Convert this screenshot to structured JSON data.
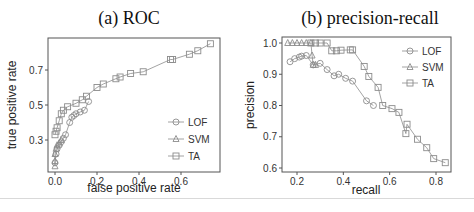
{
  "chart_data": [
    {
      "type": "line",
      "title": "(a) ROC",
      "xlabel": "false positive rate",
      "ylabel": "true positive rate",
      "xticks": [
        "0.0",
        "0.2",
        "0.4",
        "0.6"
      ],
      "yticks": [
        "0.3",
        "0.5",
        "0.7"
      ],
      "xlim": [
        -0.03,
        0.77
      ],
      "ylim": [
        0.13,
        0.88
      ],
      "grid": false,
      "legend_position": "inside-right",
      "series": [
        {
          "name": "LOF",
          "marker": "circle",
          "x": [
            0.0,
            0.005,
            0.01,
            0.02,
            0.03,
            0.04,
            0.05,
            0.07,
            0.08,
            0.09,
            0.1,
            0.12,
            0.14,
            0.16
          ],
          "y": [
            0.17,
            0.22,
            0.25,
            0.27,
            0.29,
            0.31,
            0.33,
            0.4,
            0.43,
            0.44,
            0.45,
            0.46,
            0.47,
            0.52
          ]
        },
        {
          "name": "SVM",
          "marker": "triangle",
          "x": [
            0.0,
            0.0,
            0.0,
            0.005,
            0.01,
            0.02,
            0.03
          ],
          "y": [
            0.15,
            0.18,
            0.22,
            0.25,
            0.27,
            0.28,
            0.3
          ]
        },
        {
          "name": "TA",
          "marker": "square",
          "x": [
            0.0,
            0.005,
            0.01,
            0.02,
            0.03,
            0.04,
            0.06,
            0.1,
            0.13,
            0.15,
            0.2,
            0.23,
            0.29,
            0.31,
            0.36,
            0.42,
            0.55,
            0.56,
            0.64,
            0.68,
            0.74
          ],
          "y": [
            0.33,
            0.35,
            0.37,
            0.41,
            0.45,
            0.47,
            0.49,
            0.51,
            0.53,
            0.55,
            0.6,
            0.62,
            0.65,
            0.66,
            0.68,
            0.69,
            0.76,
            0.76,
            0.79,
            0.81,
            0.85
          ]
        }
      ]
    },
    {
      "type": "line",
      "title": "(b) precision-recall",
      "xlabel": "recall",
      "ylabel": "precision",
      "xticks": [
        "0.2",
        "0.4",
        "0.6",
        "0.8"
      ],
      "yticks": [
        "0.6",
        "0.7",
        "0.8",
        "0.9",
        "1.0"
      ],
      "xlim": [
        0.14,
        0.87
      ],
      "ylim": [
        0.595,
        1.02
      ],
      "grid": false,
      "legend_position": "top-right",
      "series": [
        {
          "name": "LOF",
          "marker": "circle",
          "x": [
            0.17,
            0.19,
            0.21,
            0.22,
            0.24,
            0.27,
            0.3,
            0.33,
            0.36,
            0.38,
            0.41,
            0.44,
            0.5,
            0.53
          ],
          "y": [
            0.94,
            0.95,
            0.955,
            0.958,
            0.96,
            0.93,
            0.935,
            0.915,
            0.895,
            0.9,
            0.887,
            0.878,
            0.815,
            0.8
          ]
        },
        {
          "name": "SVM",
          "marker": "triangle",
          "x": [
            0.16,
            0.18,
            0.2,
            0.22,
            0.24,
            0.26,
            0.265,
            0.27,
            0.28
          ],
          "y": [
            1.0,
            1.0,
            1.0,
            1.0,
            1.0,
            1.0,
            0.96,
            0.93,
            0.93
          ]
        },
        {
          "name": "TA",
          "marker": "square",
          "x": [
            0.26,
            0.28,
            0.3,
            0.33,
            0.35,
            0.37,
            0.39,
            0.43,
            0.44,
            0.49,
            0.51,
            0.55,
            0.57,
            0.61,
            0.64,
            0.67,
            0.675,
            0.72,
            0.76,
            0.79,
            0.84
          ],
          "y": [
            1.0,
            1.0,
            1.0,
            1.0,
            0.975,
            0.975,
            0.977,
            0.978,
            0.978,
            0.925,
            0.893,
            0.858,
            0.8,
            0.79,
            0.778,
            0.71,
            0.74,
            0.692,
            0.665,
            0.63,
            0.617
          ]
        }
      ]
    }
  ],
  "titles": {
    "roc": "(a) ROC",
    "pr": "(b) precision-recall"
  },
  "colors": {
    "line": "#8c8c8c",
    "frame": "#555555",
    "text": "#333333"
  }
}
